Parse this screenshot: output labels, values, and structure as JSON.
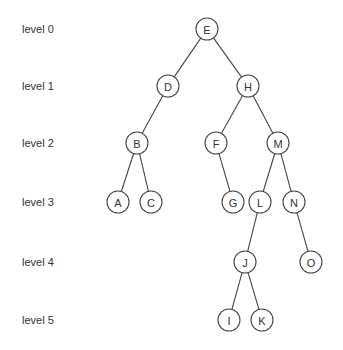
{
  "diagram": {
    "type": "binary-search-tree",
    "node_radius": 11,
    "colors": {
      "stroke": "#444444",
      "text": "#333333",
      "fill": "#ffffff"
    },
    "levels": [
      {
        "label": "level 0",
        "y": 29
      },
      {
        "label": "level 1",
        "y": 86
      },
      {
        "label": "level 2",
        "y": 143
      },
      {
        "label": "level 3",
        "y": 202
      },
      {
        "label": "level 4",
        "y": 262
      },
      {
        "label": "level 5",
        "y": 320
      }
    ],
    "nodes": [
      {
        "id": "E",
        "label": "E",
        "x": 207,
        "y": 29
      },
      {
        "id": "D",
        "label": "D",
        "x": 168,
        "y": 86
      },
      {
        "id": "H",
        "label": "H",
        "x": 248,
        "y": 86
      },
      {
        "id": "B",
        "label": "B",
        "x": 137,
        "y": 143
      },
      {
        "id": "F",
        "label": "F",
        "x": 216,
        "y": 143
      },
      {
        "id": "M",
        "label": "M",
        "x": 278,
        "y": 143
      },
      {
        "id": "A",
        "label": "A",
        "x": 118,
        "y": 202
      },
      {
        "id": "C",
        "label": "C",
        "x": 151,
        "y": 202
      },
      {
        "id": "G",
        "label": "G",
        "x": 233,
        "y": 202
      },
      {
        "id": "L",
        "label": "L",
        "x": 260,
        "y": 202
      },
      {
        "id": "N",
        "label": "N",
        "x": 294,
        "y": 202
      },
      {
        "id": "J",
        "label": "J",
        "x": 245,
        "y": 262
      },
      {
        "id": "O",
        "label": "O",
        "x": 311,
        "y": 262
      },
      {
        "id": "I",
        "label": "I",
        "x": 229,
        "y": 320
      },
      {
        "id": "K",
        "label": "K",
        "x": 262,
        "y": 320
      }
    ],
    "edges": [
      [
        "E",
        "D"
      ],
      [
        "E",
        "H"
      ],
      [
        "D",
        "B"
      ],
      [
        "H",
        "F"
      ],
      [
        "H",
        "M"
      ],
      [
        "B",
        "A"
      ],
      [
        "B",
        "C"
      ],
      [
        "F",
        "G"
      ],
      [
        "M",
        "L"
      ],
      [
        "M",
        "N"
      ],
      [
        "L",
        "J"
      ],
      [
        "N",
        "O"
      ],
      [
        "J",
        "I"
      ],
      [
        "J",
        "K"
      ]
    ]
  }
}
